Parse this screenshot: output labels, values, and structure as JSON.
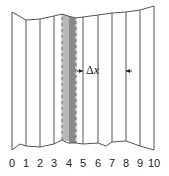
{
  "diagram": {
    "colors": {
      "line": "#555555",
      "shaded_fill": "#b8b8b8",
      "shaded_dark": "#8a8a8a",
      "dash": "#ffffff",
      "text": "#222222"
    },
    "slice_lines_x": [
      12,
      26,
      40,
      54,
      62,
      76,
      83,
      98,
      112,
      126,
      140,
      154
    ],
    "top_boundary": [
      [
        12,
        12
      ],
      [
        26,
        20
      ],
      [
        40,
        19
      ],
      [
        54,
        16
      ],
      [
        62,
        14
      ],
      [
        68,
        16
      ],
      [
        76,
        18
      ],
      [
        83,
        17
      ],
      [
        98,
        15
      ],
      [
        112,
        13
      ],
      [
        126,
        12
      ],
      [
        140,
        10
      ],
      [
        154,
        6
      ]
    ],
    "bottom_boundary": [
      [
        12,
        150
      ],
      [
        20,
        144
      ],
      [
        26,
        146
      ],
      [
        40,
        147
      ],
      [
        54,
        144
      ],
      [
        62,
        140
      ],
      [
        68,
        143
      ],
      [
        76,
        143
      ],
      [
        83,
        144
      ],
      [
        98,
        143
      ],
      [
        106,
        146
      ],
      [
        112,
        142
      ],
      [
        126,
        141
      ],
      [
        140,
        146
      ],
      [
        154,
        150
      ]
    ],
    "shaded_slice": {
      "x_left": 62,
      "x_right": 76,
      "dark_left": 69
    },
    "delta_x": {
      "label_symbol": "Δ",
      "label_var": "x",
      "x_left": 83,
      "x_right": 126,
      "y": 71
    },
    "axis_labels": [
      {
        "text": "0",
        "x": 12
      },
      {
        "text": "1",
        "x": 26
      },
      {
        "text": "2",
        "x": 40
      },
      {
        "text": "3",
        "x": 54
      },
      {
        "text": "4",
        "x": 69
      },
      {
        "text": "5",
        "x": 83
      },
      {
        "text": "6",
        "x": 98
      },
      {
        "text": "7",
        "x": 112
      },
      {
        "text": "8",
        "x": 126
      },
      {
        "text": "9",
        "x": 140
      },
      {
        "text": "10",
        "x": 154
      }
    ]
  }
}
